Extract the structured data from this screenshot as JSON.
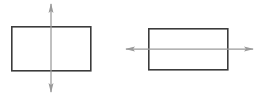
{
  "figure": {
    "background_color": "#ffffff",
    "width": 257,
    "height": 96,
    "outline_color": "#3c3c3c",
    "axis_color": "#9a9a9a",
    "panels": [
      {
        "id": "left-panel",
        "name": "rectangle-with-vertical-line-of-symmetry",
        "shape": {
          "type": "rectangle",
          "x": 11,
          "y": 26,
          "width": 80,
          "height": 45
        },
        "axis": {
          "orientation": "vertical",
          "double_headed": true,
          "x": 51,
          "y_start": 4,
          "y_end": 92,
          "head_length": 9,
          "head_width": 5
        }
      },
      {
        "id": "right-panel",
        "name": "rectangle-with-horizontal-line-of-symmetry",
        "shape": {
          "type": "rectangle",
          "x": 148,
          "y": 28,
          "width": 80,
          "height": 42
        },
        "axis": {
          "orientation": "horizontal",
          "double_headed": true,
          "y": 49,
          "x_start": 126,
          "x_end": 253,
          "head_length": 9,
          "head_width": 5
        }
      }
    ]
  }
}
